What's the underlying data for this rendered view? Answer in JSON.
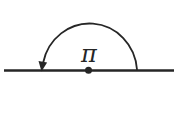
{
  "figure": {
    "angle_label": "π",
    "colors": {
      "ink": "#262626",
      "background": "#ffffff"
    },
    "geometry": {
      "canvas": {
        "width": 186,
        "height": 123
      },
      "baseline": {
        "x1": 4,
        "y1": 70.5,
        "x2": 174,
        "y2": 70.5,
        "width": 2.6
      },
      "center_dot": {
        "cx": 88.5,
        "cy": 70.3,
        "r": 3.5
      },
      "arc": {
        "d": "M 137 69.5 A 47.5 49.5 0 0 0 43.2 62.5",
        "width": 1.8
      },
      "arrowhead": {
        "points": "41.5,71.5 47.1,62.6 38.5,61.1"
      },
      "label": {
        "x": 89,
        "y": 62,
        "font_size": 24
      }
    }
  }
}
